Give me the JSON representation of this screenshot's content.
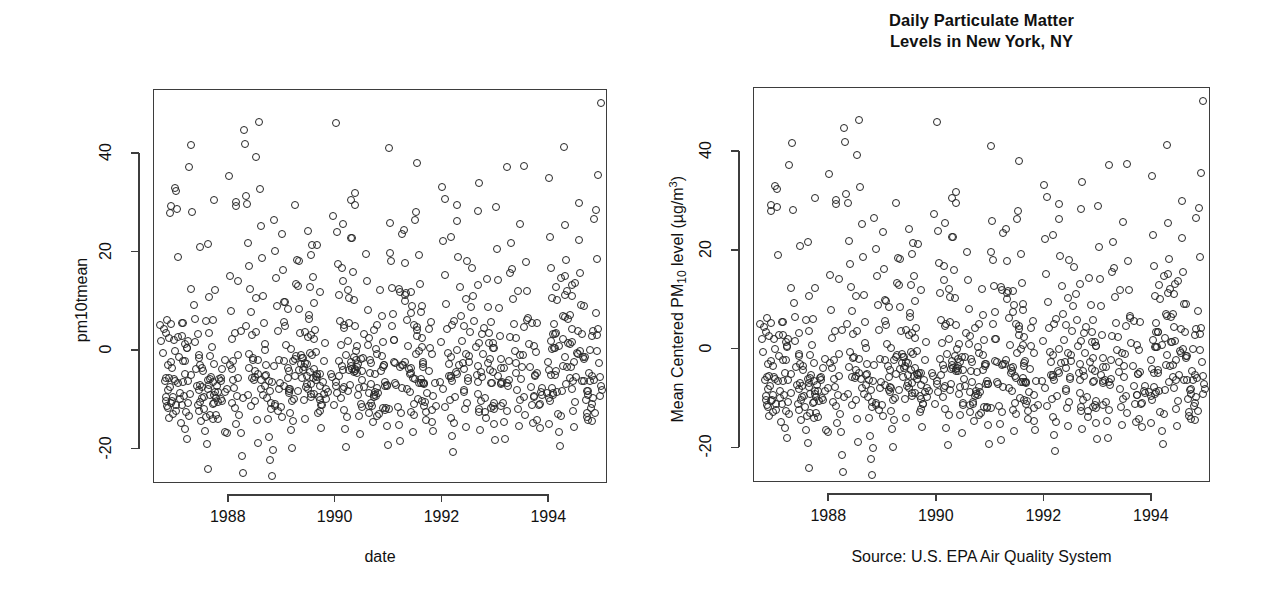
{
  "figure": {
    "title": "Daily Particulate Matter\nLevels in New York, NY",
    "caption": "Source: U.S. EPA Air Quality System"
  },
  "panels": [
    {
      "id": "left",
      "y_axis_title": "pm10tmean",
      "x_axis_title": "date",
      "title": ""
    },
    {
      "id": "right",
      "y_axis_title_parts": {
        "pre": "Mean Centered PM",
        "sub": "10",
        "mid": " level (µg",
        "slash": "/",
        "unit": "m",
        "sup": "3",
        "post": ")"
      },
      "x_axis_title": "",
      "title": "Daily Particulate Matter\nLevels in New York, NY"
    }
  ],
  "chart_data": {
    "type": "scatter",
    "title": "Daily Particulate Matter Levels in New York, NY",
    "subtitle": "Source: U.S. EPA Air Quality System",
    "xlabel": "date",
    "ylabel_left": "pm10tmean",
    "ylabel_right": "Mean Centered PM10 level (µg/m^3)",
    "xlim": [
      1986.6,
      1995.1
    ],
    "ylim": [
      -27,
      53
    ],
    "xticks": [
      1988,
      1990,
      1992,
      1994
    ],
    "xticklabels": [
      "1988",
      "1990",
      "1992",
      "1994"
    ],
    "yticks": [
      -20,
      0,
      20,
      40
    ],
    "yticklabels": [
      "-20",
      "0",
      "20",
      "40"
    ],
    "grid": false,
    "legend": "none",
    "marker": "open-circle",
    "marker_color": "#262626",
    "n_points": 510,
    "note": "Both panels show the same data; left panel uses raw variable name labels, right panel is the polished version with title, formatted axis label and source caption.",
    "points": [
      [
        1986.72,
        5.2
      ],
      [
        1986.74,
        2.1
      ],
      [
        1986.76,
        -0.4
      ],
      [
        1986.78,
        4.5
      ],
      [
        1986.8,
        -6.1
      ],
      [
        1986.82,
        -9.3
      ],
      [
        1986.84,
        -11.2
      ],
      [
        1986.86,
        -8.0
      ],
      [
        1986.88,
        -13.5
      ],
      [
        1986.9,
        -7.4
      ],
      [
        1986.92,
        -2.3
      ],
      [
        1986.94,
        -10.1
      ],
      [
        1986.96,
        -12.7
      ],
      [
        1986.98,
        -5.6
      ],
      [
        1987.02,
        32.5
      ],
      [
        1987.04,
        19.1
      ],
      [
        1987.06,
        -1.2
      ],
      [
        1987.08,
        -9.8
      ],
      [
        1987.1,
        -14.6
      ],
      [
        1987.12,
        -11.0
      ],
      [
        1987.14,
        -6.3
      ],
      [
        1987.16,
        -9.1
      ],
      [
        1987.18,
        -15.8
      ],
      [
        1987.2,
        -12.4
      ],
      [
        1987.22,
        -17.9
      ],
      [
        1987.24,
        -10.5
      ],
      [
        1987.26,
        -13.1
      ],
      [
        1987.28,
        -8.7
      ],
      [
        1987.3,
        41.8
      ],
      [
        1987.32,
        28.2
      ],
      [
        1987.34,
        9.4
      ],
      [
        1987.36,
        1.8
      ],
      [
        1987.38,
        -3.6
      ],
      [
        1987.4,
        -7.2
      ],
      [
        1987.42,
        -10.9
      ],
      [
        1987.44,
        -12.2
      ],
      [
        1987.46,
        -6.8
      ],
      [
        1987.48,
        -14.3
      ],
      [
        1987.5,
        -9.5
      ],
      [
        1987.52,
        -4.1
      ],
      [
        1987.54,
        -11.7
      ],
      [
        1987.56,
        -16.2
      ],
      [
        1987.58,
        -13.4
      ],
      [
        1987.6,
        -18.8
      ],
      [
        1987.62,
        -23.9
      ],
      [
        1987.64,
        -9.0
      ],
      [
        1987.66,
        -5.2
      ],
      [
        1987.68,
        0.9
      ],
      [
        1987.7,
        6.3
      ],
      [
        1987.72,
        -2.7
      ],
      [
        1987.74,
        -8.4
      ],
      [
        1987.76,
        -12.9
      ],
      [
        1987.78,
        -7.1
      ],
      [
        1987.8,
        -10.3
      ],
      [
        1988.0,
        35.6
      ],
      [
        1988.02,
        15.2
      ],
      [
        1988.04,
        8.1
      ],
      [
        1988.06,
        2.4
      ],
      [
        1988.08,
        -2.0
      ],
      [
        1988.1,
        -7.6
      ],
      [
        1988.12,
        -11.5
      ],
      [
        1988.14,
        -14.8
      ],
      [
        1988.16,
        -9.2
      ],
      [
        1988.18,
        -5.4
      ],
      [
        1988.2,
        -13.0
      ],
      [
        1988.22,
        -16.7
      ],
      [
        1988.24,
        -21.3
      ],
      [
        1988.26,
        -24.8
      ],
      [
        1988.28,
        44.9
      ],
      [
        1988.3,
        42.1
      ],
      [
        1988.32,
        31.5
      ],
      [
        1988.34,
        29.8
      ],
      [
        1988.36,
        22.0
      ],
      [
        1988.38,
        17.3
      ],
      [
        1988.4,
        12.6
      ],
      [
        1988.42,
        7.9
      ],
      [
        1988.44,
        3.2
      ],
      [
        1988.46,
        -1.5
      ],
      [
        1988.48,
        -5.8
      ],
      [
        1988.5,
        -10.2
      ],
      [
        1988.52,
        -14.0
      ],
      [
        1988.54,
        -18.6
      ],
      [
        1988.56,
        46.5
      ],
      [
        1988.58,
        33.0
      ],
      [
        1988.6,
        25.4
      ],
      [
        1988.62,
        18.8
      ],
      [
        1988.64,
        11.1
      ],
      [
        1988.66,
        5.6
      ],
      [
        1988.68,
        0.3
      ],
      [
        1988.7,
        -4.9
      ],
      [
        1988.72,
        -9.6
      ],
      [
        1988.74,
        -13.8
      ],
      [
        1988.76,
        -17.5
      ],
      [
        1988.78,
        -22.1
      ],
      [
        1988.8,
        -25.4
      ],
      [
        1988.82,
        -20.0
      ],
      [
        1988.84,
        26.7
      ],
      [
        1988.86,
        20.3
      ],
      [
        1988.88,
        14.9
      ],
      [
        1988.9,
        9.1
      ],
      [
        1988.92,
        4.0
      ],
      [
        1988.94,
        -1.8
      ],
      [
        1988.96,
        -6.5
      ],
      [
        1988.98,
        -11.3
      ],
      [
        1989.0,
        23.8
      ],
      [
        1989.02,
        16.4
      ],
      [
        1989.04,
        10.0
      ],
      [
        1989.06,
        5.1
      ],
      [
        1989.08,
        1.2
      ],
      [
        1989.1,
        -3.4
      ],
      [
        1989.12,
        -8.1
      ],
      [
        1989.14,
        -12.5
      ],
      [
        1989.16,
        -16.0
      ],
      [
        1989.18,
        -19.7
      ],
      [
        1989.2,
        -14.2
      ],
      [
        1989.22,
        -9.8
      ],
      [
        1989.24,
        -5.0
      ],
      [
        1989.26,
        -1.1
      ],
      [
        1989.28,
        18.5
      ],
      [
        1989.3,
        13.2
      ],
      [
        1989.32,
        8.6
      ],
      [
        1989.34,
        3.7
      ],
      [
        1989.36,
        -0.9
      ],
      [
        1989.38,
        -5.5
      ],
      [
        1989.4,
        -10.0
      ],
      [
        1989.42,
        -13.9
      ],
      [
        1989.44,
        -7.3
      ],
      [
        1989.46,
        -2.6
      ],
      [
        1989.48,
        2.9
      ],
      [
        1989.5,
        7.4
      ],
      [
        1989.52,
        -4.2
      ],
      [
        1989.54,
        -8.8
      ],
      [
        1989.56,
        21.6
      ],
      [
        1989.58,
        15.0
      ],
      [
        1989.6,
        9.8
      ],
      [
        1989.62,
        4.3
      ],
      [
        1989.64,
        -0.2
      ],
      [
        1989.66,
        -4.7
      ],
      [
        1989.68,
        -9.4
      ],
      [
        1989.7,
        -12.1
      ],
      [
        1989.72,
        -15.6
      ],
      [
        1989.74,
        -11.0
      ],
      [
        1989.76,
        -6.2
      ],
      [
        1989.78,
        -2.0
      ],
      [
        1989.8,
        1.6
      ],
      [
        1989.82,
        -7.8
      ],
      [
        1990.0,
        46.2
      ],
      [
        1990.02,
        24.1
      ],
      [
        1990.04,
        17.6
      ],
      [
        1990.06,
        11.4
      ],
      [
        1990.08,
        6.0
      ],
      [
        1990.1,
        1.3
      ],
      [
        1990.12,
        -3.1
      ],
      [
        1990.14,
        -7.7
      ],
      [
        1990.16,
        -12.0
      ],
      [
        1990.18,
        -15.9
      ],
      [
        1990.2,
        -19.4
      ],
      [
        1990.22,
        -13.3
      ],
      [
        1990.24,
        -8.2
      ],
      [
        1990.26,
        -3.9
      ],
      [
        1990.28,
        30.7
      ],
      [
        1990.3,
        22.9
      ],
      [
        1990.32,
        16.1
      ],
      [
        1990.34,
        10.4
      ],
      [
        1990.36,
        5.0
      ],
      [
        1990.38,
        0.1
      ],
      [
        1990.4,
        -4.4
      ],
      [
        1990.42,
        -8.9
      ],
      [
        1990.44,
        -13.2
      ],
      [
        1990.46,
        -16.8
      ],
      [
        1990.48,
        -10.7
      ],
      [
        1990.5,
        -5.9
      ],
      [
        1990.52,
        -1.4
      ],
      [
        1990.54,
        3.4
      ],
      [
        1990.56,
        19.8
      ],
      [
        1990.58,
        14.2
      ],
      [
        1990.6,
        8.3
      ],
      [
        1990.62,
        2.7
      ],
      [
        1990.64,
        -1.9
      ],
      [
        1990.66,
        -6.6
      ],
      [
        1990.68,
        -11.1
      ],
      [
        1990.7,
        -14.5
      ],
      [
        1990.72,
        -9.0
      ],
      [
        1990.74,
        -4.6
      ],
      [
        1990.76,
        0.5
      ],
      [
        1990.78,
        5.3
      ],
      [
        1990.8,
        -8.5
      ],
      [
        1990.82,
        -12.8
      ],
      [
        1990.84,
        12.3
      ],
      [
        1990.86,
        7.1
      ],
      [
        1990.88,
        1.9
      ],
      [
        1990.9,
        -2.8
      ],
      [
        1990.92,
        -7.0
      ],
      [
        1990.94,
        -11.6
      ],
      [
        1990.96,
        -15.2
      ],
      [
        1990.98,
        -19.0
      ],
      [
        1991.0,
        41.2
      ],
      [
        1991.02,
        26.0
      ],
      [
        1991.04,
        18.2
      ],
      [
        1991.06,
        12.8
      ],
      [
        1991.08,
        7.6
      ],
      [
        1991.1,
        2.2
      ],
      [
        1991.12,
        -2.4
      ],
      [
        1991.14,
        -6.9
      ],
      [
        1991.16,
        -11.4
      ],
      [
        1991.18,
        -15.0
      ],
      [
        1991.2,
        -18.3
      ],
      [
        1991.22,
        -12.6
      ],
      [
        1991.24,
        -7.5
      ],
      [
        1991.26,
        -2.9
      ],
      [
        1991.28,
        24.5
      ],
      [
        1991.3,
        17.9
      ],
      [
        1991.32,
        11.8
      ],
      [
        1991.34,
        6.4
      ],
      [
        1991.36,
        1.0
      ],
      [
        1991.38,
        -3.7
      ],
      [
        1991.4,
        -8.3
      ],
      [
        1991.42,
        -12.3
      ],
      [
        1991.44,
        -16.5
      ],
      [
        1991.46,
        -10.8
      ],
      [
        1991.48,
        -5.7
      ],
      [
        1991.5,
        -0.6
      ],
      [
        1991.52,
        4.2
      ],
      [
        1991.54,
        -9.7
      ],
      [
        1991.56,
        19.4
      ],
      [
        1991.58,
        13.6
      ],
      [
        1991.6,
        8.0
      ],
      [
        1991.62,
        2.6
      ],
      [
        1991.64,
        -2.2
      ],
      [
        1991.66,
        -6.7
      ],
      [
        1991.68,
        -10.4
      ],
      [
        1991.7,
        -14.1
      ],
      [
        1991.72,
        -8.6
      ],
      [
        1991.74,
        -4.0
      ],
      [
        1991.76,
        0.7
      ],
      [
        1991.78,
        5.9
      ],
      [
        1991.8,
        -11.9
      ],
      [
        1991.82,
        -16.3
      ],
      [
        1992.0,
        33.4
      ],
      [
        1992.02,
        22.4
      ],
      [
        1992.04,
        15.4
      ],
      [
        1992.06,
        9.6
      ],
      [
        1992.08,
        4.4
      ],
      [
        1992.1,
        -0.5
      ],
      [
        1992.12,
        -5.1
      ],
      [
        1992.14,
        -9.9
      ],
      [
        1992.16,
        -13.6
      ],
      [
        1992.18,
        -17.2
      ],
      [
        1992.2,
        -20.5
      ],
      [
        1992.22,
        -14.7
      ],
      [
        1992.24,
        -9.3
      ],
      [
        1992.26,
        -4.3
      ],
      [
        1992.28,
        26.4
      ],
      [
        1992.3,
        19.0
      ],
      [
        1992.32,
        13.0
      ],
      [
        1992.34,
        7.2
      ],
      [
        1992.36,
        2.0
      ],
      [
        1992.38,
        -2.5
      ],
      [
        1992.4,
        -7.9
      ],
      [
        1992.42,
        -11.8
      ],
      [
        1992.44,
        -15.5
      ],
      [
        1992.46,
        -10.6
      ],
      [
        1992.48,
        -6.0
      ],
      [
        1992.5,
        -1.0
      ],
      [
        1992.52,
        3.8
      ],
      [
        1992.54,
        8.9
      ],
      [
        1992.56,
        16.8
      ],
      [
        1992.58,
        11.2
      ],
      [
        1992.6,
        6.1
      ],
      [
        1992.62,
        0.8
      ],
      [
        1992.64,
        -4.8
      ],
      [
        1992.66,
        -8.7
      ],
      [
        1992.68,
        -12.4
      ],
      [
        1992.7,
        -16.1
      ],
      [
        1992.72,
        -10.1
      ],
      [
        1992.74,
        -5.3
      ],
      [
        1992.76,
        -0.7
      ],
      [
        1992.78,
        4.6
      ],
      [
        1992.8,
        -9.5
      ],
      [
        1992.82,
        -13.7
      ],
      [
        1992.84,
        14.6
      ],
      [
        1992.86,
        9.0
      ],
      [
        1992.88,
        3.6
      ],
      [
        1992.9,
        -1.6
      ],
      [
        1992.92,
        -6.4
      ],
      [
        1992.94,
        -11.2
      ],
      [
        1992.96,
        -14.9
      ],
      [
        1992.98,
        -18.1
      ],
      [
        1993.0,
        29.2
      ],
      [
        1993.02,
        20.8
      ],
      [
        1993.04,
        14.4
      ],
      [
        1993.06,
        8.8
      ],
      [
        1993.08,
        3.0
      ],
      [
        1993.1,
        -1.7
      ],
      [
        1993.12,
        -6.2
      ],
      [
        1993.14,
        -10.5
      ],
      [
        1993.16,
        -14.4
      ],
      [
        1993.18,
        -17.8
      ],
      [
        1993.2,
        -12.2
      ],
      [
        1993.22,
        -7.2
      ],
      [
        1993.24,
        -2.1
      ],
      [
        1993.26,
        2.8
      ],
      [
        1993.28,
        21.9
      ],
      [
        1993.3,
        16.6
      ],
      [
        1993.32,
        10.6
      ],
      [
        1993.34,
        5.4
      ],
      [
        1993.36,
        0.0
      ],
      [
        1993.38,
        -4.5
      ],
      [
        1993.4,
        -8.0
      ],
      [
        1993.42,
        -11.7
      ],
      [
        1993.44,
        -15.3
      ],
      [
        1993.46,
        -9.9
      ],
      [
        1993.48,
        -5.6
      ],
      [
        1993.5,
        -0.8
      ],
      [
        1993.52,
        4.8
      ],
      [
        1993.54,
        -12.9
      ],
      [
        1993.56,
        18.0
      ],
      [
        1993.58,
        12.1
      ],
      [
        1993.6,
        6.8
      ],
      [
        1993.62,
        1.4
      ],
      [
        1993.64,
        -3.3
      ],
      [
        1993.66,
        -7.4
      ],
      [
        1993.68,
        -11.0
      ],
      [
        1993.7,
        -14.6
      ],
      [
        1993.72,
        -9.1
      ],
      [
        1993.74,
        -4.9
      ],
      [
        1993.76,
        -0.1
      ],
      [
        1993.78,
        5.7
      ],
      [
        1993.8,
        -10.9
      ],
      [
        1993.82,
        -15.7
      ],
      [
        1994.0,
        35.1
      ],
      [
        1994.02,
        23.2
      ],
      [
        1994.04,
        16.9
      ],
      [
        1994.06,
        10.8
      ],
      [
        1994.08,
        5.5
      ],
      [
        1994.1,
        0.6
      ],
      [
        1994.12,
        -4.1
      ],
      [
        1994.14,
        -8.4
      ],
      [
        1994.16,
        -12.7
      ],
      [
        1994.18,
        -16.4
      ],
      [
        1994.2,
        -19.2
      ],
      [
        1994.22,
        -13.1
      ],
      [
        1994.24,
        -8.1
      ],
      [
        1994.26,
        -3.0
      ],
      [
        1994.28,
        41.5
      ],
      [
        1994.3,
        25.6
      ],
      [
        1994.32,
        18.4
      ],
      [
        1994.34,
        12.2
      ],
      [
        1994.36,
        6.6
      ],
      [
        1994.38,
        1.5
      ],
      [
        1994.4,
        -3.2
      ],
      [
        1994.42,
        -7.8
      ],
      [
        1994.44,
        -12.1
      ],
      [
        1994.46,
        -15.4
      ],
      [
        1994.48,
        -10.3
      ],
      [
        1994.5,
        -5.2
      ],
      [
        1994.52,
        -0.3
      ],
      [
        1994.54,
        4.1
      ],
      [
        1994.56,
        22.6
      ],
      [
        1994.58,
        15.8
      ],
      [
        1994.6,
        9.3
      ],
      [
        1994.62,
        3.5
      ],
      [
        1994.64,
        -1.3
      ],
      [
        1994.66,
        -6.1
      ],
      [
        1994.68,
        -10.0
      ],
      [
        1994.7,
        -13.4
      ],
      [
        1994.72,
        -8.9
      ],
      [
        1994.74,
        -4.4
      ],
      [
        1994.76,
        0.2
      ],
      [
        1994.78,
        -11.5
      ],
      [
        1994.8,
        -14.3
      ],
      [
        1994.82,
        -9.6
      ],
      [
        1994.96,
        50.4
      ],
      [
        1994.92,
        35.8
      ],
      [
        1994.88,
        28.6
      ],
      [
        1994.9,
        18.7
      ],
      [
        1994.94,
        -2.4
      ],
      [
        1994.98,
        -7.9
      ],
      [
        1994.86,
        -12.5
      ],
      [
        1994.84,
        -5.8
      ]
    ]
  }
}
